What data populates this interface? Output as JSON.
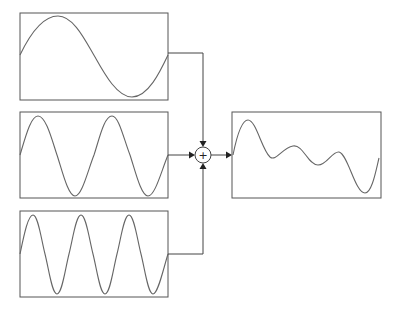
{
  "diagram": {
    "title": "",
    "inputs": [
      {
        "label": "",
        "periods": 1,
        "box": {
          "x": 20,
          "y": 13,
          "w": 148,
          "h": 87
        }
      },
      {
        "label": "",
        "periods": 2,
        "box": {
          "x": 20,
          "y": 112,
          "w": 148,
          "h": 86
        }
      },
      {
        "label": "",
        "periods": 3,
        "box": {
          "x": 20,
          "y": 211,
          "w": 148,
          "h": 86
        }
      }
    ],
    "summing_junction": {
      "symbol": "+",
      "cx": 203,
      "cy": 155,
      "r": 8
    },
    "output": {
      "label": "",
      "box": {
        "x": 232,
        "y": 112,
        "w": 149,
        "h": 86
      }
    },
    "colors": {
      "stroke": "#555555",
      "wave": "#666666",
      "arrow": "#222222",
      "background": "#ffffff"
    }
  }
}
